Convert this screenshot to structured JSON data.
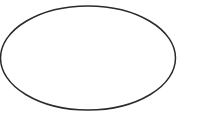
{
  "canvas": {
    "width": "199",
    "height": "123",
    "background_color": "#ffffff"
  },
  "shape": {
    "type": "ellipse",
    "cx": "88",
    "cy": "58",
    "rx": "87.5",
    "ry": "52",
    "fill": "none",
    "stroke_color": "#2a2a2a",
    "stroke_width": "1.5"
  }
}
